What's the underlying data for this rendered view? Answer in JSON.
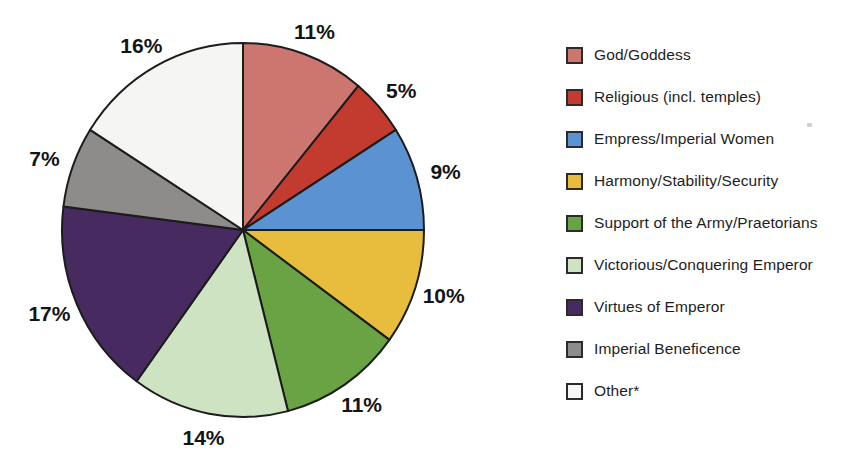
{
  "chart_data": {
    "type": "pie",
    "title": "",
    "start_angle_deg": 0,
    "direction": "clockwise",
    "legend_position": "right",
    "background_color": "#ffffff",
    "outline_color": "#1c1c1c",
    "percent_label_color": "#141414",
    "slices": [
      {
        "label": "God/Goddess",
        "value": 11,
        "percent_label": "11%",
        "color": "#CD7670"
      },
      {
        "label": "Religious (incl. temples)",
        "value": 5,
        "percent_label": "5%",
        "color": "#C23B2E"
      },
      {
        "label": "Empress/Imperial Women",
        "value": 9,
        "percent_label": "9%",
        "color": "#5B92D1"
      },
      {
        "label": "Harmony/Stability/Security",
        "value": 10,
        "percent_label": "10%",
        "color": "#E8BC3D"
      },
      {
        "label": "Support of the Army/Praetorians",
        "value": 11,
        "percent_label": "11%",
        "color": "#6AA343"
      },
      {
        "label": "Victorious/Conquering Emperor",
        "value": 14,
        "percent_label": "14%",
        "color": "#CEE3C1"
      },
      {
        "label": "Virtues of Emperor",
        "value": 17,
        "percent_label": "17%",
        "color": "#472A60"
      },
      {
        "label": "Imperial Beneficence",
        "value": 7,
        "percent_label": "7%",
        "color": "#8E8C8A"
      },
      {
        "label": "Other*",
        "value": 16,
        "percent_label": "16%",
        "color": "#F5F5F3"
      }
    ]
  }
}
